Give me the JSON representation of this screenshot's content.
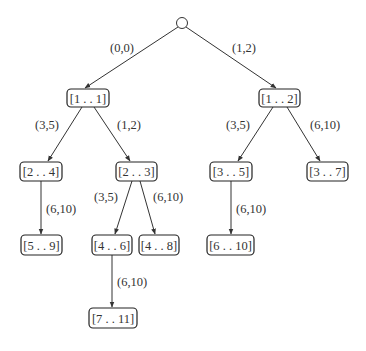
{
  "diagram": {
    "type": "tree",
    "root": {
      "id": "root",
      "label": "",
      "cx": 182,
      "cy": 23,
      "r": 5.5
    },
    "nodes": [
      {
        "id": "n1",
        "label": "[1 . . 1]",
        "x": 67,
        "y": 89,
        "w": 42,
        "h": 18
      },
      {
        "id": "n2",
        "label": "[1 . . 2]",
        "x": 259,
        "y": 89,
        "w": 41,
        "h": 18
      },
      {
        "id": "n3",
        "label": "[2 . . 4]",
        "x": 20,
        "y": 162,
        "w": 42,
        "h": 19
      },
      {
        "id": "n4",
        "label": "[2 . . 3]",
        "x": 116,
        "y": 162,
        "w": 41,
        "h": 19
      },
      {
        "id": "n5",
        "label": "[3 . . 5]",
        "x": 210,
        "y": 162,
        "w": 42,
        "h": 19
      },
      {
        "id": "n6",
        "label": "[3 . . 7]",
        "x": 307,
        "y": 162,
        "w": 41,
        "h": 19
      },
      {
        "id": "n7",
        "label": "[5 . . 9]",
        "x": 21,
        "y": 235,
        "w": 41,
        "h": 20
      },
      {
        "id": "n8",
        "label": "[4 . . 6]",
        "x": 92,
        "y": 235,
        "w": 40,
        "h": 20
      },
      {
        "id": "n9",
        "label": "[4 . . 8]",
        "x": 139,
        "y": 235,
        "w": 40,
        "h": 20
      },
      {
        "id": "n10",
        "label": "[6 . . 10]",
        "x": 207,
        "y": 235,
        "w": 47,
        "h": 20
      },
      {
        "id": "n11",
        "label": "[7 . . 11]",
        "x": 89,
        "y": 308,
        "w": 48,
        "h": 20
      }
    ],
    "edges": [
      {
        "from": "root",
        "to": "n1",
        "label": "(0,0)",
        "x1": 178,
        "y1": 27,
        "x2": 85,
        "y2": 88,
        "lx": 110,
        "ly": 52
      },
      {
        "from": "root",
        "to": "n2",
        "label": "(1,2)",
        "x1": 186,
        "y1": 27,
        "x2": 276,
        "y2": 88,
        "lx": 232,
        "ly": 52
      },
      {
        "from": "n1",
        "to": "n3",
        "label": "(3,5)",
        "x1": 82,
        "y1": 107,
        "x2": 48,
        "y2": 161,
        "lx": 35,
        "ly": 129
      },
      {
        "from": "n1",
        "to": "n4",
        "label": "(1,2)",
        "x1": 94,
        "y1": 107,
        "x2": 130,
        "y2": 161,
        "lx": 117,
        "ly": 129
      },
      {
        "from": "n2",
        "to": "n5",
        "label": "(3,5)",
        "x1": 273,
        "y1": 107,
        "x2": 238,
        "y2": 161,
        "lx": 226,
        "ly": 129
      },
      {
        "from": "n2",
        "to": "n6",
        "label": "(6,10)",
        "x1": 287,
        "y1": 107,
        "x2": 320,
        "y2": 161,
        "lx": 310,
        "ly": 129
      },
      {
        "from": "n3",
        "to": "n7",
        "label": "(6,10)",
        "x1": 41,
        "y1": 181,
        "x2": 41,
        "y2": 234,
        "lx": 46,
        "ly": 213
      },
      {
        "from": "n4",
        "to": "n8",
        "label": "(3,5)",
        "x1": 132,
        "y1": 181,
        "x2": 115,
        "y2": 234,
        "lx": 94,
        "ly": 201
      },
      {
        "from": "n4",
        "to": "n9",
        "label": "(6,10)",
        "x1": 140,
        "y1": 181,
        "x2": 155,
        "y2": 234,
        "lx": 153,
        "ly": 201
      },
      {
        "from": "n5",
        "to": "n10",
        "label": "(6,10)",
        "x1": 231,
        "y1": 181,
        "x2": 231,
        "y2": 234,
        "lx": 236,
        "ly": 213
      },
      {
        "from": "n8",
        "to": "n11",
        "label": "(6,10)",
        "x1": 112,
        "y1": 255,
        "x2": 112,
        "y2": 307,
        "lx": 117,
        "ly": 286
      }
    ],
    "colors": {
      "stroke": "#333333",
      "box_stroke": "#222222",
      "text": "#333333",
      "background": "#ffffff"
    }
  }
}
